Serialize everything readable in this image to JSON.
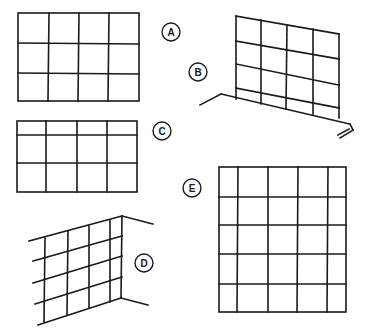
{
  "figures": [
    {
      "id": "A",
      "label": "A",
      "description": "flat grid 4 columns x 3 rows"
    },
    {
      "id": "B",
      "label": "B",
      "description": "perspective wall grid 4 columns x 4 rows with base rail"
    },
    {
      "id": "C",
      "label": "C",
      "description": "flat grid 4 columns with narrow top row"
    },
    {
      "id": "D",
      "label": "D",
      "description": "perspective corner wall grid"
    },
    {
      "id": "E",
      "label": "E",
      "description": "tall grid 5 columns x 5 rows with narrow end columns"
    }
  ]
}
